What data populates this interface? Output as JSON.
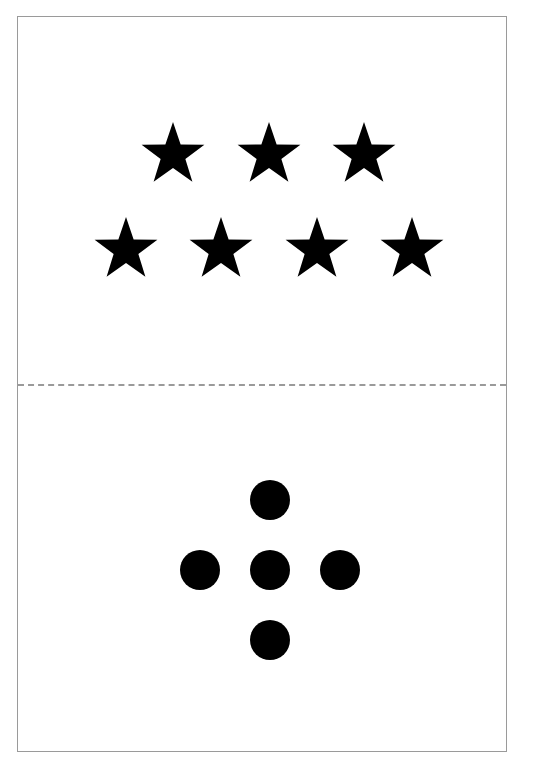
{
  "card": {
    "border_color": "#9a9a9a",
    "background": "#ffffff"
  },
  "top_section": {
    "shape": "star",
    "count": 7,
    "color": "#000000",
    "rows": [
      {
        "count": 3,
        "centers_x": [
          173,
          269,
          364
        ],
        "center_y": 155
      },
      {
        "count": 4,
        "centers_x": [
          126,
          221,
          317,
          412
        ],
        "center_y": 250
      }
    ],
    "outer_radius": 33,
    "inner_radius": 13
  },
  "divider": {
    "style": "dashed",
    "color": "#9a9a9a",
    "y": 384
  },
  "bottom_section": {
    "shape": "circle",
    "count": 5,
    "color": "#000000",
    "radius": 20,
    "dots": [
      {
        "cx": 270,
        "cy": 500,
        "position": "top"
      },
      {
        "cx": 200,
        "cy": 570,
        "position": "left"
      },
      {
        "cx": 270,
        "cy": 570,
        "position": "center"
      },
      {
        "cx": 340,
        "cy": 570,
        "position": "right"
      },
      {
        "cx": 270,
        "cy": 640,
        "position": "bottom"
      }
    ]
  }
}
